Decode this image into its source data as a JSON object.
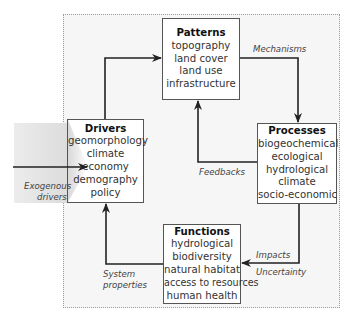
{
  "diagram": {
    "nodes": {
      "patterns": {
        "title": "Patterns",
        "items": [
          "topography",
          "land cover",
          "land use",
          "infrastructure"
        ]
      },
      "drivers": {
        "title": "Drivers",
        "items": [
          "geomorphology",
          "climate",
          "economy",
          "demography",
          "policy"
        ]
      },
      "processes": {
        "title": "Processes",
        "items": [
          "biogeochemical",
          "ecological",
          "hydrological",
          "climate",
          "socio-economic"
        ]
      },
      "functions": {
        "title": "Functions",
        "items": [
          "hydrological",
          "biodiversity",
          "natural habitat",
          "access to resources",
          "human health"
        ]
      }
    },
    "edges": {
      "mechanisms": "Mechanisms",
      "feedbacks": "Feedbacks",
      "impacts": "Impacts",
      "uncertainty": "Uncertainty",
      "system_properties_1": "System",
      "system_properties_2": "properties",
      "exogenous_1": "Exogenous",
      "exogenous_2": "drivers"
    },
    "colors": {
      "line": "#222222",
      "box_border": "#555555",
      "frame_bg": "#f6f6f6",
      "shade": "#dcdcdc"
    }
  }
}
